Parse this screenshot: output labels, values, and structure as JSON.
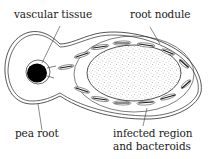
{
  "diagram": {
    "labels": {
      "vascular_tissue": "vascular tissue",
      "root_nodule": "root nodule",
      "pea_root": "pea root",
      "infected_line1": "infected region",
      "infected_line2": "and bacteroids"
    },
    "colors": {
      "line": "#2a2a2a",
      "vascular": "#000000",
      "stipple": "#9a9a9a",
      "background": "#ffffff"
    }
  }
}
